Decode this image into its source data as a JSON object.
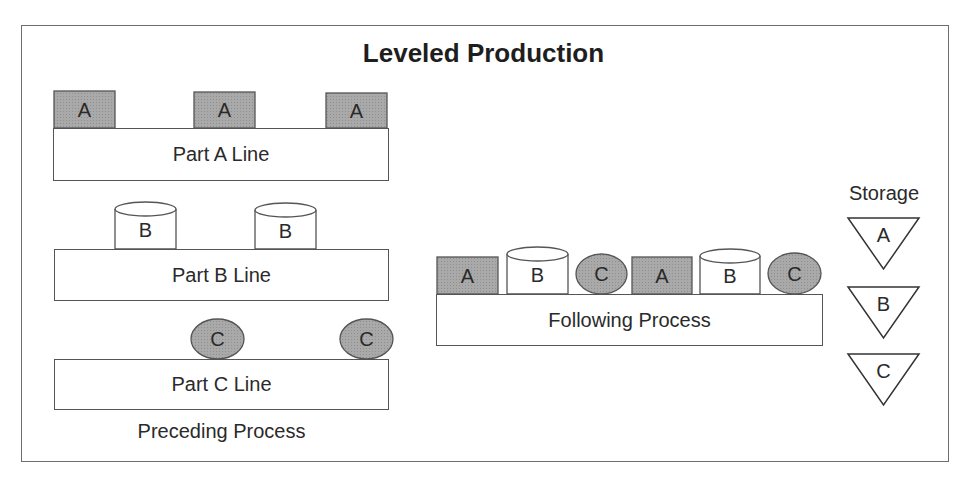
{
  "diagram": {
    "title": "Leveled Production",
    "colors": {
      "stroke": "#555555",
      "shaded_fill": "#a9a9a9",
      "white_fill": "#ffffff",
      "frame": "#6e6e6e"
    },
    "preceding": {
      "caption": "Preceding Process",
      "lines": [
        {
          "label": "Part A Line",
          "box": [
            53,
            128,
            336,
            53
          ]
        },
        {
          "label": "Part B Line",
          "box": [
            54,
            249,
            335,
            52
          ]
        },
        {
          "label": "Part C Line",
          "box": [
            54,
            359,
            335,
            51
          ]
        }
      ]
    },
    "following": {
      "label": "Following Process",
      "box": [
        436,
        294,
        387,
        52
      ]
    },
    "storage": {
      "label": "Storage",
      "items": [
        {
          "letter": "A",
          "top": 218
        },
        {
          "letter": "B",
          "top": 287
        },
        {
          "letter": "C",
          "top": 354
        }
      ]
    },
    "parts": [
      {
        "kind": "box",
        "letter": "A",
        "x": 54,
        "y": 91,
        "w": 61,
        "h": 37,
        "group": "part-a-line"
      },
      {
        "kind": "box",
        "letter": "A",
        "x": 194,
        "y": 92,
        "w": 61,
        "h": 36,
        "group": "part-a-line"
      },
      {
        "kind": "box",
        "letter": "A",
        "x": 326,
        "y": 93,
        "w": 61,
        "h": 35,
        "group": "part-a-line"
      },
      {
        "kind": "cylinder",
        "letter": "B",
        "x": 115,
        "y": 202,
        "w": 61,
        "h": 47,
        "group": "part-b-line"
      },
      {
        "kind": "cylinder",
        "letter": "B",
        "x": 255,
        "y": 203,
        "w": 61,
        "h": 46,
        "group": "part-b-line"
      },
      {
        "kind": "ellipse",
        "letter": "C",
        "x": 191,
        "y": 319,
        "w": 53,
        "h": 40,
        "group": "part-c-line"
      },
      {
        "kind": "ellipse",
        "letter": "C",
        "x": 340,
        "y": 319,
        "w": 53,
        "h": 40,
        "group": "part-c-line"
      },
      {
        "kind": "box",
        "letter": "A",
        "x": 437,
        "y": 257,
        "w": 61,
        "h": 37,
        "group": "following"
      },
      {
        "kind": "cylinder",
        "letter": "B",
        "x": 507,
        "y": 247,
        "w": 61,
        "h": 47,
        "group": "following"
      },
      {
        "kind": "ellipse",
        "letter": "C",
        "x": 576,
        "y": 254,
        "w": 51,
        "h": 40,
        "group": "following"
      },
      {
        "kind": "box",
        "letter": "A",
        "x": 632,
        "y": 257,
        "w": 60,
        "h": 37,
        "group": "following"
      },
      {
        "kind": "cylinder",
        "letter": "B",
        "x": 700,
        "y": 249,
        "w": 60,
        "h": 45,
        "group": "following"
      },
      {
        "kind": "ellipse",
        "letter": "C",
        "x": 768,
        "y": 253,
        "w": 53,
        "h": 41,
        "group": "following"
      }
    ]
  }
}
